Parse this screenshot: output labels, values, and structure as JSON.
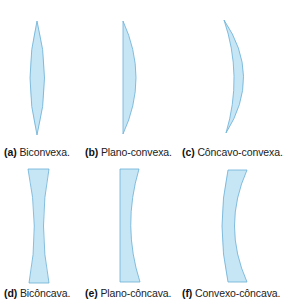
{
  "figure": {
    "lens_fill": "#c6e6f6",
    "lens_stroke": "#6aaed6",
    "items": [
      {
        "letter": "(a)",
        "label": "Biconvexa."
      },
      {
        "letter": "(b)",
        "label": "Plano-convexa."
      },
      {
        "letter": "(c)",
        "label": "Côncavo-convexa."
      },
      {
        "letter": "(d)",
        "label": "Bicôncava."
      },
      {
        "letter": "(e)",
        "label": "Plano-côncava."
      },
      {
        "letter": "(f)",
        "label": "Convexo-côncava."
      }
    ]
  }
}
